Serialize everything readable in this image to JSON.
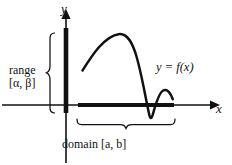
{
  "figure": {
    "background_color": "#ffffff",
    "ink_color": "#111111"
  },
  "axes": {
    "y_label": "y",
    "x_label": "x",
    "origin": {
      "x": 66,
      "y": 105
    },
    "y_axis": {
      "x": 66,
      "top": 12,
      "bottom": 163,
      "arrow": "up"
    },
    "x_axis": {
      "y": 105,
      "left": 2,
      "right": 215,
      "arrow": "right"
    }
  },
  "curve": {
    "label": "y = f(x)",
    "label_parts": {
      "y": "y",
      "equals": "=",
      "f": "f",
      "open": "(",
      "x": "x",
      "close": ")"
    },
    "description": "rises from left to a high peak, plunges steeply below the x-axis, then rises to a small bump and ends",
    "start_point": {
      "x": 82,
      "y": 70
    },
    "peak_point": {
      "x": 120,
      "y": 34
    },
    "min_point": {
      "x": 150,
      "y": 119
    },
    "bump_point": {
      "x": 163,
      "y": 90
    },
    "end_point": {
      "x": 173,
      "y": 99
    }
  },
  "range_marker": {
    "label_line1": "range",
    "label_line2": "[α, β]",
    "alpha": "α",
    "beta": "β",
    "segment_axis": "y",
    "segment_from": 28,
    "segment_to": 113,
    "brace_orientation": "right-facing"
  },
  "domain_marker": {
    "label_text": "domain [a, b]",
    "label_word": "domain",
    "open_bracket": "[",
    "a": "a",
    "comma": ",",
    "b": "b",
    "close_bracket": "]",
    "segment_axis": "x",
    "segment_from": 78,
    "segment_to": 174,
    "brace_orientation": "under"
  }
}
